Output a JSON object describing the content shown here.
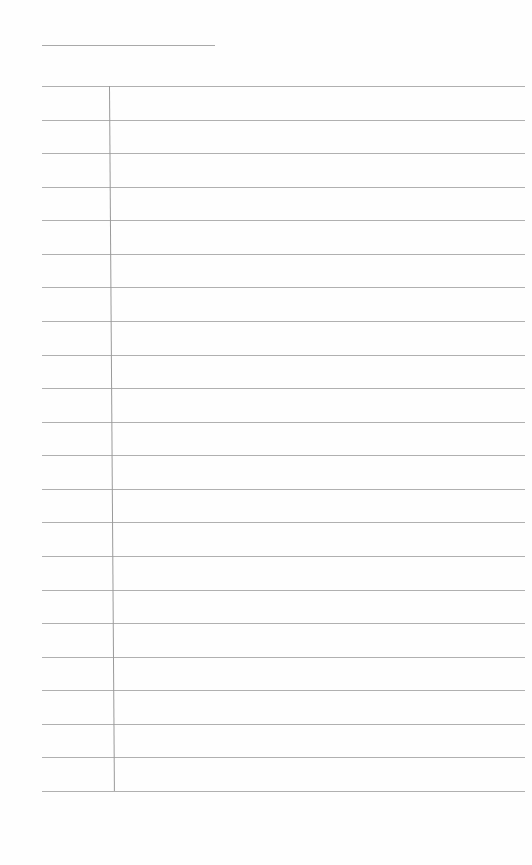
{
  "document": {
    "type": "lined-paper",
    "header_text": "",
    "title_line": {
      "x": 42,
      "y": 45,
      "width": 173
    },
    "rules": {
      "count": 22,
      "first_y": 86,
      "spacing": 33.57,
      "x_start": 42,
      "x_end": 525,
      "color": "#b0b0b0"
    },
    "margin_line": {
      "x_top": 109,
      "x_bottom": 114,
      "y_top": 86,
      "y_bottom": 791,
      "color": "#9a9a9a"
    },
    "background": "#fefefe"
  }
}
